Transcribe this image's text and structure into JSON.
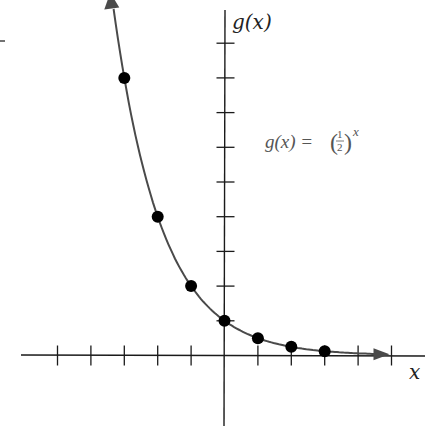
{
  "chart_data": {
    "type": "line",
    "title": "",
    "function": "g(x) = (1/2)^x",
    "xlabel": "x",
    "ylabel": "g(x)",
    "x": [
      -3,
      -2,
      -1,
      0,
      1,
      2,
      3
    ],
    "series": [
      {
        "name": "g(x) = (1/2)^x",
        "values": [
          8,
          4,
          2,
          1,
          0.5,
          0.25,
          0.125
        ],
        "markers": true
      }
    ],
    "x_ticks": [
      -5,
      -4,
      -3,
      -2,
      -1,
      1,
      2,
      3,
      4,
      5
    ],
    "y_ticks": [
      1,
      2,
      3,
      4,
      5,
      6,
      7,
      8,
      9
    ],
    "xlim": [
      -6,
      6
    ],
    "ylim": [
      -2,
      10
    ],
    "grid": false,
    "legend": "none",
    "annotations": [
      {
        "text": "g(x) = (1/2)^x",
        "position": "upper right of y-axis"
      }
    ]
  },
  "labels": {
    "y_axis": "g(x)",
    "x_axis": "x",
    "equation_lhs": "g(x) =",
    "equation_num": "1",
    "equation_den": "2",
    "equation_exp": "x"
  },
  "colors": {
    "axis": "#1a1a1a",
    "curve": "#4a4a4a",
    "points": "#000000"
  }
}
